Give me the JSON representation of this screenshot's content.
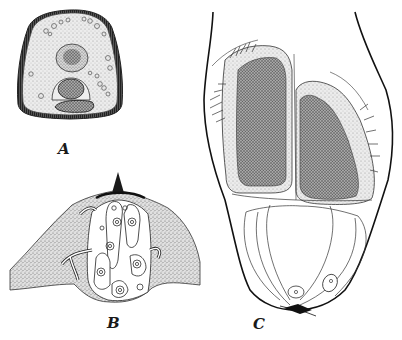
{
  "figure": {
    "panels": [
      {
        "id": "A",
        "label": "A"
      },
      {
        "id": "B",
        "label": "B"
      },
      {
        "id": "C",
        "label": "C"
      }
    ]
  },
  "colors": {
    "ink": "#1a1a1a",
    "stipple_light": "#e4e4e4",
    "stipple_mid": "#c8c8c8",
    "stipple_dark": "#8a8a8a",
    "paper": "#ffffff"
  }
}
